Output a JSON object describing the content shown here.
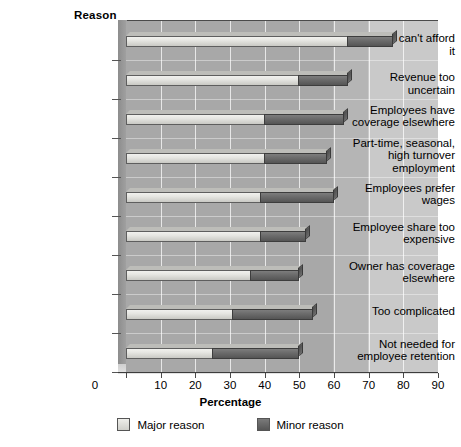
{
  "chart_data": {
    "type": "bar",
    "orientation": "horizontal",
    "stacked": true,
    "title": "",
    "xlabel": "Percentage",
    "ylabel": "Reason",
    "xlim": [
      0,
      90
    ],
    "xticks": [
      0,
      10,
      20,
      30,
      40,
      50,
      60,
      70,
      80,
      90
    ],
    "grid": true,
    "legend_position": "bottom",
    "categories": [
      "Business can't afford it",
      "Revenue too uncertain",
      "Employees have coverage elsewhere",
      "Part-time, seasonal, high turnover employment",
      "Employees prefer wages",
      "Employee share too expensive",
      "Owner has coverage elsewhere",
      "Too complicated",
      "Not needed for employee retention"
    ],
    "category_labels": [
      [
        "Business can't afford it"
      ],
      [
        "Revenue too uncertain"
      ],
      [
        "Employees have",
        "coverage elsewhere"
      ],
      [
        "Part-time, seasonal,",
        "high turnover",
        "employment"
      ],
      [
        "Employees prefer",
        "wages"
      ],
      [
        "Employee share too",
        "expensive"
      ],
      [
        "Owner has coverage",
        "elsewhere"
      ],
      [
        "Too complicated"
      ],
      [
        "Not needed for",
        "employee retention"
      ]
    ],
    "series": [
      {
        "name": "Major reason",
        "color": "#e6e6e2",
        "values": [
          64,
          50,
          40,
          40,
          39,
          39,
          36,
          31,
          25
        ]
      },
      {
        "name": "Minor reason",
        "color": "#6c6c6c",
        "values": [
          13,
          14,
          23,
          18,
          21,
          13,
          14,
          23,
          25
        ]
      }
    ],
    "totals": [
      77,
      64,
      63,
      58,
      60,
      52,
      50,
      54,
      50
    ]
  },
  "legend": {
    "items": [
      {
        "label": "Major reason",
        "swatch": "major"
      },
      {
        "label": "Minor reason",
        "swatch": "minor"
      }
    ]
  },
  "axis": {
    "y_title": "Reason",
    "x_title": "Percentage",
    "x_tick_labels": [
      "0",
      "10",
      "20",
      "30",
      "40",
      "50",
      "60",
      "70",
      "80",
      "90"
    ]
  },
  "colors": {
    "plot_background": "#a8a8a8",
    "plot_background_light": "#c9c9c9",
    "major_bar": "#e6e6e2",
    "minor_bar": "#6c6c6c",
    "gridline": "#ffffff",
    "text": "#000000"
  }
}
